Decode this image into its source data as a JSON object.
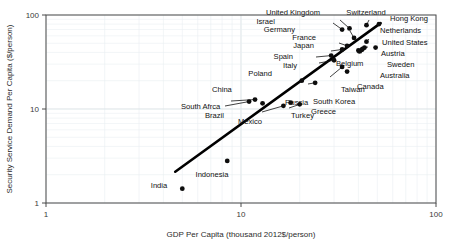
{
  "chart_data": {
    "type": "scatter",
    "title": "",
    "xlabel": "GDP Per Capita (thousand 2012$/person)",
    "ylabel": "Security Service Demand Per Capita ($/person)",
    "xscale": "log",
    "yscale": "log",
    "xlim": [
      1,
      100
    ],
    "ylim": [
      1,
      100
    ],
    "xticks": [
      "1",
      "10",
      "100"
    ],
    "yticks": [
      "1",
      "10",
      "100"
    ],
    "grid": true,
    "legend": "none",
    "trendline": {
      "label": "fit-line",
      "x": [
        4.6,
        52.0
      ],
      "y": [
        2.15,
        82.0
      ]
    },
    "points": [
      {
        "label": "India",
        "x": 5.0,
        "y": 1.42,
        "lx": 159,
        "ly": 188,
        "anchor": "middle",
        "leader": false
      },
      {
        "label": "Indonesia",
        "x": 8.5,
        "y": 2.8,
        "lx": 212,
        "ly": 177,
        "anchor": "middle",
        "leader": false
      },
      {
        "label": "South Afrca",
        "x": 11.0,
        "y": 12.0,
        "lx": 181,
        "ly": 109,
        "anchor": "start",
        "leader": true,
        "ex": 225,
        "ey": 106
      },
      {
        "label": "China",
        "x": 11.8,
        "y": 12.6,
        "lx": 212,
        "ly": 92,
        "anchor": "start",
        "leader": true,
        "ex": 231,
        "ey": 101
      },
      {
        "label": "Brazil",
        "x": 12.9,
        "y": 11.5,
        "lx": 205,
        "ly": 118,
        "anchor": "start",
        "leader": false
      },
      {
        "label": "Mexico",
        "x": 16.5,
        "y": 10.8,
        "lx": 250,
        "ly": 124,
        "anchor": "middle",
        "leader": true,
        "ex": 262,
        "ey": 112
      },
      {
        "label": "Russia",
        "x": 18.0,
        "y": 11.7,
        "lx": 285,
        "ly": 105,
        "anchor": "start",
        "leader": false
      },
      {
        "label": "Turkey",
        "x": 20.0,
        "y": 11.2,
        "lx": 291,
        "ly": 118,
        "anchor": "start",
        "leader": true,
        "ex": 289,
        "ey": 108
      },
      {
        "label": "Poland",
        "x": 20.5,
        "y": 20.0,
        "lx": 272,
        "ly": 76,
        "anchor": "end",
        "leader": false
      },
      {
        "label": "Greece",
        "x": 24.0,
        "y": 19.0,
        "lx": 311,
        "ly": 114,
        "anchor": "start",
        "leader": true,
        "ex": 308,
        "ey": 84
      },
      {
        "label": "South Korea",
        "x": 33.0,
        "y": 28.0,
        "lx": 313,
        "ly": 104,
        "anchor": "start",
        "leader": true,
        "ex": 330,
        "ey": 77
      },
      {
        "label": "Taiwan",
        "x": 35.0,
        "y": 25.0,
        "lx": 341,
        "ly": 92,
        "anchor": "start",
        "leader": false
      },
      {
        "label": "Italy",
        "x": 30.0,
        "y": 33.0,
        "lx": 297,
        "ly": 68,
        "anchor": "end",
        "leader": true,
        "ex": 319,
        "ey": 63
      },
      {
        "label": "Spain",
        "x": 29.0,
        "y": 37.0,
        "lx": 293,
        "ly": 59,
        "anchor": "end",
        "leader": true,
        "ex": 316,
        "ey": 57
      },
      {
        "label": "Belgium",
        "x": 40.0,
        "y": 42.0,
        "lx": 336,
        "ly": 66,
        "anchor": "start",
        "leader": true,
        "ex": 358,
        "ey": 53
      },
      {
        "label": "Japan",
        "x": 33.0,
        "y": 43.0,
        "lx": 314,
        "ly": 48,
        "anchor": "end",
        "leader": true,
        "ex": 331,
        "ey": 51
      },
      {
        "label": "France",
        "x": 35.0,
        "y": 47.0,
        "lx": 316,
        "ly": 40,
        "anchor": "end",
        "leader": true,
        "ex": 339,
        "ey": 43
      },
      {
        "label": "Germany",
        "x": 38.0,
        "y": 57.0,
        "lx": 295,
        "ly": 32,
        "anchor": "end",
        "leader": true,
        "ex": 350,
        "ey": 31
      },
      {
        "label": "Israel",
        "x": 33.0,
        "y": 70.0,
        "lx": 275,
        "ly": 24,
        "anchor": "end",
        "leader": true,
        "ex": 333,
        "ey": 23
      },
      {
        "label": "United Kingdom",
        "x": 36.0,
        "y": 72.0,
        "lx": 320,
        "ly": 15,
        "anchor": "end",
        "leader": true,
        "ex": 340,
        "ey": 20
      },
      {
        "label": "Switzerland",
        "x": 44.0,
        "y": 78.0,
        "lx": 366,
        "ly": 15,
        "anchor": "middle",
        "leader": true,
        "ex": 369,
        "ey": 20
      },
      {
        "label": "Hong Kong",
        "x": 51.0,
        "y": 80.0,
        "lx": 390,
        "ly": 21,
        "anchor": "start",
        "leader": false
      },
      {
        "label": "Netherlands",
        "x": 44.0,
        "y": 52.0,
        "lx": 380,
        "ly": 33,
        "anchor": "start",
        "leader": true,
        "ex": 369,
        "ey": 39
      },
      {
        "label": "United States",
        "x": 49.0,
        "y": 45.0,
        "lx": 382,
        "ly": 45,
        "anchor": "start",
        "leader": false
      },
      {
        "label": "Austria",
        "x": 43.0,
        "y": 45.0,
        "lx": 381,
        "ly": 56,
        "anchor": "start",
        "leader": true,
        "ex": 368,
        "ey": 47
      },
      {
        "label": "Sweden",
        "x": 42.0,
        "y": 43.5,
        "lx": 387,
        "ly": 67,
        "anchor": "start",
        "leader": true,
        "ex": 366,
        "ey": 49
      },
      {
        "label": "Australia",
        "x": 41.5,
        "y": 42.5,
        "lx": 380,
        "ly": 78,
        "anchor": "start",
        "leader": true,
        "ex": 364,
        "ey": 51
      },
      {
        "label": "Canada",
        "x": 40.5,
        "y": 41.0,
        "lx": 357,
        "ly": 89,
        "anchor": "start",
        "leader": true,
        "ex": 362,
        "ey": 53
      }
    ]
  }
}
